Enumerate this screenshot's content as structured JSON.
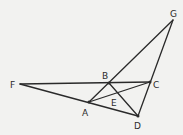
{
  "diagram": {
    "title": "",
    "points": [
      {
        "id": "F",
        "label": "F"
      },
      {
        "id": "B",
        "label": "B"
      },
      {
        "id": "C",
        "label": "C"
      },
      {
        "id": "A",
        "label": "A"
      },
      {
        "id": "E",
        "label": "E"
      },
      {
        "id": "D",
        "label": "D"
      },
      {
        "id": "G",
        "label": "G"
      }
    ],
    "segments": [
      [
        "F",
        "C"
      ],
      [
        "F",
        "D"
      ],
      [
        "A",
        "G"
      ],
      [
        "G",
        "D"
      ],
      [
        "A",
        "C"
      ],
      [
        "B",
        "D"
      ]
    ],
    "colors": {
      "stroke": "#2a2a2a",
      "background": "#f2f2f0"
    }
  }
}
